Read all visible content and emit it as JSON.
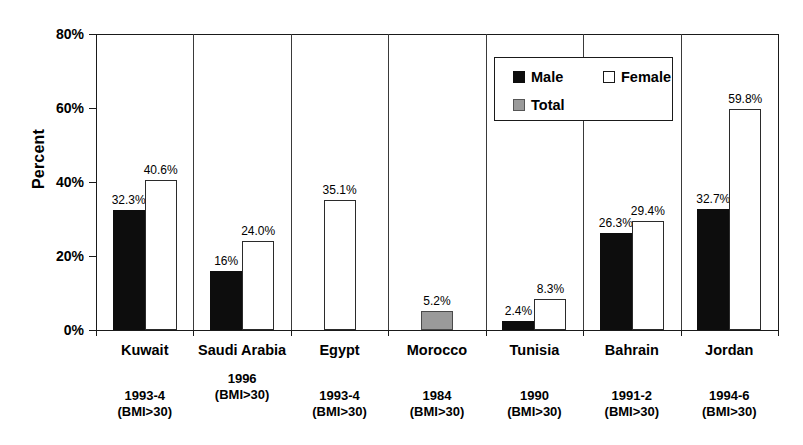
{
  "chart_data": {
    "type": "bar",
    "title": "",
    "subtitle": "",
    "xlabel": "",
    "ylabel": "Percent",
    "ylim": [
      0,
      80
    ],
    "yticks": [
      "0%",
      "20%",
      "40%",
      "60%",
      "80%"
    ],
    "grid": false,
    "legend_position": "top-right-inside",
    "categories": [
      "Kuwait",
      "Saudi Arabia",
      "Egypt",
      "Morocco",
      "Tunisia",
      "Bahrain",
      "Jordan"
    ],
    "category_years": [
      "1993-4",
      "1996",
      "1993-4",
      "1984",
      "1990",
      "1991-2",
      "1994-6"
    ],
    "category_criteria": [
      "(BMI>30)",
      "(BMI>30)",
      "(BMI>30)",
      "(BMI>30)",
      "(BMI>30)",
      "(BMI>30)",
      "(BMI>30)"
    ],
    "series": [
      {
        "name": "Male",
        "color": "#0d0d0d",
        "values": [
          32.3,
          16.0,
          null,
          null,
          2.4,
          26.3,
          32.7
        ],
        "labels": [
          "32.3%",
          "16%",
          "",
          "",
          "2.4%",
          "26.3%",
          "32.7%"
        ]
      },
      {
        "name": "Female",
        "color": "#ffffff",
        "values": [
          40.6,
          24.0,
          35.1,
          null,
          8.3,
          29.4,
          59.8
        ],
        "labels": [
          "40.6%",
          "24.0%",
          "35.1%",
          "",
          "8.3%",
          "29.4%",
          "59.8%"
        ]
      },
      {
        "name": "Total",
        "color": "#9a9a9a",
        "values": [
          null,
          null,
          null,
          5.2,
          null,
          null,
          null
        ],
        "labels": [
          "",
          "",
          "",
          "5.2%",
          "",
          "",
          ""
        ]
      }
    ]
  },
  "axis": {
    "y_label": "Percent",
    "y_ticks": [
      {
        "label": "80%",
        "value": 80
      },
      {
        "label": "60%",
        "value": 60
      },
      {
        "label": "40%",
        "value": 40
      },
      {
        "label": "20%",
        "value": 20
      },
      {
        "label": "0%",
        "value": 0
      }
    ]
  },
  "legend": {
    "items": [
      {
        "label": "Male",
        "swatch": "male"
      },
      {
        "label": "Female",
        "swatch": "female"
      },
      {
        "label": "Total",
        "swatch": "total"
      }
    ]
  },
  "categories": [
    {
      "name": "Kuwait",
      "year": "1993-4",
      "criteria": "(BMI>30)"
    },
    {
      "name": "Saudi Arabia",
      "year": "1996",
      "criteria": "(BMI>30)"
    },
    {
      "name": "Egypt",
      "year": "1993-4",
      "criteria": "(BMI>30)"
    },
    {
      "name": "Morocco",
      "year": "1984",
      "criteria": "(BMI>30)"
    },
    {
      "name": "Tunisia",
      "year": "1990",
      "criteria": "(BMI>30)"
    },
    {
      "name": "Bahrain",
      "year": "1991-2",
      "criteria": "(BMI>30)"
    },
    {
      "name": "Jordan",
      "year": "1994-6",
      "criteria": "(BMI>30)"
    }
  ],
  "bars": [
    {
      "category": "Kuwait",
      "series": "Male",
      "value": 32.3,
      "label": "32.3%"
    },
    {
      "category": "Kuwait",
      "series": "Female",
      "value": 40.6,
      "label": "40.6%"
    },
    {
      "category": "Saudi Arabia",
      "series": "Male",
      "value": 16.0,
      "label": "16%"
    },
    {
      "category": "Saudi Arabia",
      "series": "Female",
      "value": 24.0,
      "label": "24.0%"
    },
    {
      "category": "Egypt",
      "series": "Female",
      "value": 35.1,
      "label": "35.1%"
    },
    {
      "category": "Morocco",
      "series": "Total",
      "value": 5.2,
      "label": "5.2%"
    },
    {
      "category": "Tunisia",
      "series": "Male",
      "value": 2.4,
      "label": "2.4%"
    },
    {
      "category": "Tunisia",
      "series": "Female",
      "value": 8.3,
      "label": "8.3%"
    },
    {
      "category": "Bahrain",
      "series": "Male",
      "value": 26.3,
      "label": "26.3%"
    },
    {
      "category": "Bahrain",
      "series": "Female",
      "value": 29.4,
      "label": "29.4%"
    },
    {
      "category": "Jordan",
      "series": "Male",
      "value": 32.7,
      "label": "32.7%"
    },
    {
      "category": "Jordan",
      "series": "Female",
      "value": 59.8,
      "label": "59.8%"
    }
  ]
}
